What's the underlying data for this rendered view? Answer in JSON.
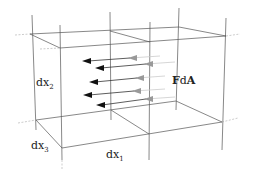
{
  "diagram": {
    "type": "volume-element-with-surface-forces",
    "labels": {
      "dx1": {
        "base": "dx",
        "sub": "1"
      },
      "dx2": {
        "base": "dx",
        "sub": "2"
      },
      "dx3": {
        "base": "dx",
        "sub": "3"
      },
      "force": {
        "bold1": "F",
        "mid": "d",
        "bold2": "A"
      }
    },
    "arrow_count": 5,
    "colors": {
      "edge": "#555555",
      "arrow_head_dark": "#111111",
      "arrow_head_mid": "#999999",
      "arrow_tail": "#cccccc"
    }
  }
}
